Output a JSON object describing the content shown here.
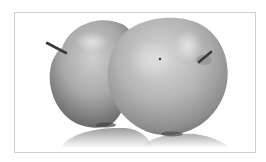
{
  "image": {
    "subject": "two apples",
    "style": "grayscale photograph",
    "frame_color": "#cfcfcf",
    "background_color": "#ffffff"
  },
  "colors": {
    "apple_light": "#d4d4d4",
    "apple_mid": "#a8a8a8",
    "apple_dark": "#6e6e6e",
    "stem": "#3a3a3a",
    "reflection": "#c8c8c8"
  }
}
